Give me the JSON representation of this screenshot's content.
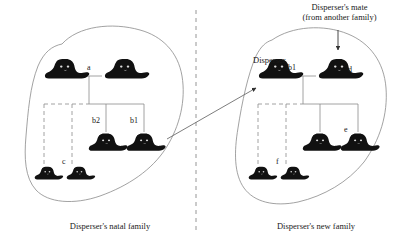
{
  "figure": {
    "type": "pedigree-dispersal-diagram",
    "background_color": "#ffffff",
    "line_color": "#7a7a7a",
    "animal_color": "#111111",
    "text_color": "#1a1a1a"
  },
  "annotations": {
    "disperser_label": "Disperser",
    "mate_label_line1": "Disperser's mate",
    "mate_label_line2": "(from another family)"
  },
  "captions": {
    "left": "Disperser's natal family",
    "right": "Disperser's new family"
  },
  "left_family": {
    "individuals": [
      {
        "id": "",
        "role": "sire",
        "size": "adult"
      },
      {
        "id": "",
        "role": "dam",
        "size": "adult"
      },
      {
        "id": "b2",
        "role": "offspring",
        "size": "adult"
      },
      {
        "id": "b1",
        "role": "offspring-disperser",
        "size": "adult"
      },
      {
        "id": "c",
        "role": "offspring",
        "size": "juvenile"
      },
      {
        "id": "",
        "role": "offspring",
        "size": "juvenile"
      }
    ],
    "link_labels": {
      "pair_bond": "a",
      "offspring_b2": "b2",
      "offspring_b1": "b1",
      "juvenile_group": "c"
    }
  },
  "right_family": {
    "individuals": [
      {
        "id": "b1",
        "role": "disperser",
        "size": "adult"
      },
      {
        "id": "d",
        "role": "mate",
        "size": "adult"
      },
      {
        "id": "e",
        "role": "offspring",
        "size": "adult"
      },
      {
        "id": "",
        "role": "offspring",
        "size": "adult"
      },
      {
        "id": "f",
        "role": "offspring",
        "size": "juvenile"
      },
      {
        "id": "",
        "role": "offspring",
        "size": "juvenile"
      }
    ],
    "link_labels": {
      "disperser": "b1",
      "mate": "d",
      "offspring_e": "e",
      "juvenile_group": "f"
    }
  }
}
